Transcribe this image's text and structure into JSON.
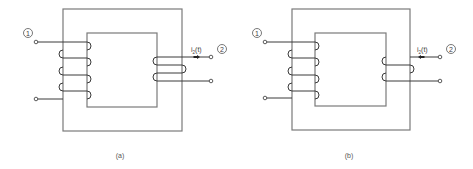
{
  "figures": [
    {
      "id": "a",
      "caption": "(a)",
      "primary_port_label": "1",
      "secondary_port_label": "2",
      "current_label": "i",
      "current_subscript": "2",
      "current_suffix": "(t)",
      "current_direction": "into-terminal",
      "primary_turns": 4,
      "secondary_turns": 2
    },
    {
      "id": "b",
      "caption": "(b)",
      "primary_port_label": "1",
      "secondary_port_label": "2",
      "current_label": "i",
      "current_subscript": "2",
      "current_suffix": "(t)",
      "current_direction": "out-of-terminal",
      "primary_turns": 4,
      "secondary_turns": 2
    }
  ],
  "colors": {
    "core": "#7a7a7a",
    "wire": "#3a3a3a",
    "background": "#ffffff"
  }
}
